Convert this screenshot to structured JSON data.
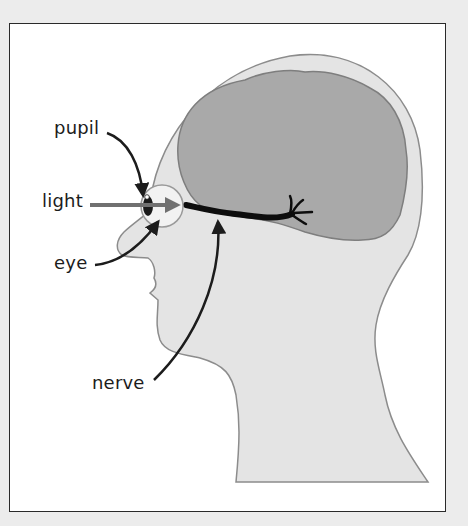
{
  "diagram": {
    "labels": {
      "pupil": "pupil",
      "light": "light",
      "eye": "eye",
      "nerve": "nerve"
    },
    "colors": {
      "background": "#ececec",
      "frame_fill": "#ffffff",
      "frame_border": "#2a2a2a",
      "head_fill": "#e4e4e4",
      "head_outline": "#8c8c8c",
      "brain_fill": "#a9a9a9",
      "brain_outline": "#7e7e7e",
      "eye_fill": "#f2f2f2",
      "pupil_fill": "#1a1a1a",
      "light_arrow": "#707070",
      "nerve": "#0d0d0d",
      "pointer": "#1c1c1c"
    }
  }
}
